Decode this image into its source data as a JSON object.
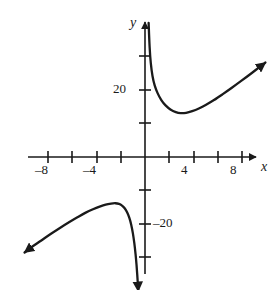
{
  "figure": {
    "kind": "coordinate-plane-graph",
    "width": 280,
    "height": 290,
    "background_color": "#ffffff",
    "ink_color": "#1a1a1a"
  },
  "axes": {
    "x_axis_name": "x",
    "y_axis_name": "y",
    "x_tick_labels": [
      "–8",
      "–4",
      "4",
      "8"
    ],
    "y_tick_labels": [
      "20",
      "–20"
    ],
    "x_label_neg8": "–8",
    "x_label_neg4": "–4",
    "x_label_4": "4",
    "x_label_8": "8",
    "y_label_20": "20",
    "y_label_neg20": "–20"
  },
  "chart_data": {
    "type": "line",
    "title": "",
    "xlabel": "x",
    "ylabel": "y",
    "xlim": [
      -9.5,
      10.5
    ],
    "ylim": [
      -40,
      40
    ],
    "grid": false,
    "legend": null,
    "x_ticks": [
      -8,
      -6,
      -4,
      -2,
      2,
      4,
      6,
      8
    ],
    "x_tick_labels_shown": [
      -8,
      -4,
      4,
      8
    ],
    "y_ticks": [
      -30,
      -20,
      -10,
      10,
      20,
      30
    ],
    "y_tick_labels_shown": [
      20,
      -20
    ],
    "x_unit_px": 12.1,
    "y_unit_px": 3.35,
    "origin_px": [
      145,
      157
    ],
    "vertical_asymptote_x": 0.2,
    "annotations": [
      {
        "text": "upper branch rises to +infinity at the vertical asymptote"
      },
      {
        "text": "upper branch local minimum near (2.9, 13)"
      },
      {
        "text": "lower branch local maximum near (-2.5, -14)"
      },
      {
        "text": "lower branch falls to -infinity at the vertical asymptote"
      }
    ],
    "series": [
      {
        "name": "upper-branch",
        "arrow_start": false,
        "arrow_end": true,
        "points": [
          [
            0.3,
            40.0
          ],
          [
            0.38,
            33.0
          ],
          [
            0.48,
            28.0
          ],
          [
            0.62,
            24.2
          ],
          [
            0.8,
            21.4
          ],
          [
            1.05,
            19.0
          ],
          [
            1.35,
            17.0
          ],
          [
            1.7,
            15.4
          ],
          [
            2.1,
            14.2
          ],
          [
            2.55,
            13.4
          ],
          [
            2.95,
            13.1
          ],
          [
            3.4,
            13.2
          ],
          [
            3.9,
            13.7
          ],
          [
            4.45,
            14.5
          ],
          [
            5.05,
            15.6
          ],
          [
            5.7,
            17.0
          ],
          [
            6.4,
            18.7
          ],
          [
            7.15,
            20.6
          ],
          [
            7.95,
            22.7
          ],
          [
            8.8,
            25.0
          ],
          [
            9.7,
            27.5
          ],
          [
            9.95,
            28.2
          ]
        ]
      },
      {
        "name": "lower-branch",
        "arrow_start": true,
        "arrow_end": true,
        "points": [
          [
            -9.95,
            -28.5
          ],
          [
            -9.4,
            -27.0
          ],
          [
            -8.6,
            -25.0
          ],
          [
            -7.8,
            -23.0
          ],
          [
            -7.0,
            -21.1
          ],
          [
            -6.25,
            -19.4
          ],
          [
            -5.55,
            -17.9
          ],
          [
            -4.9,
            -16.6
          ],
          [
            -4.3,
            -15.6
          ],
          [
            -3.75,
            -14.8
          ],
          [
            -3.25,
            -14.2
          ],
          [
            -2.8,
            -13.9
          ],
          [
            -2.45,
            -13.8
          ],
          [
            -2.15,
            -14.0
          ],
          [
            -1.9,
            -14.5
          ],
          [
            -1.68,
            -15.3
          ],
          [
            -1.48,
            -16.5
          ],
          [
            -1.3,
            -18.1
          ],
          [
            -1.14,
            -20.2
          ],
          [
            -1.0,
            -22.8
          ],
          [
            -0.88,
            -25.8
          ],
          [
            -0.78,
            -29.0
          ],
          [
            -0.7,
            -32.2
          ],
          [
            -0.64,
            -35.2
          ],
          [
            -0.59,
            -38.0
          ],
          [
            -0.56,
            -40.0
          ]
        ]
      }
    ]
  }
}
